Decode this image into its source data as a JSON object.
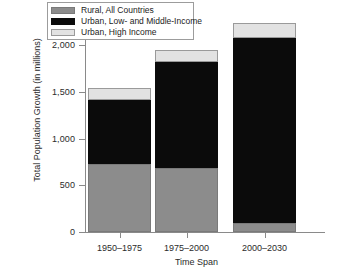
{
  "chart_data": {
    "type": "bar",
    "subtype": "stacked",
    "title": "",
    "xlabel": "Time Span",
    "ylabel": "Total Population Growth (in millions)",
    "categories": [
      "1950–1975",
      "1975–2000",
      "2000–2030"
    ],
    "ylim": [
      0,
      2200
    ],
    "yticks": [
      0,
      500,
      1000,
      1500,
      2000
    ],
    "ytick_labels": [
      "0",
      "500",
      "1,000",
      "1,500",
      "2,000"
    ],
    "grid": false,
    "legend_position": "top-left-inside",
    "series": [
      {
        "name": "Rural, All Countries",
        "color": "#8c8c8c",
        "values": [
          730,
          680,
          100
        ]
      },
      {
        "name": "Urban, Low- and Middle-Income",
        "color": "#0b0b0b",
        "values": [
          680,
          1135,
          1980
        ]
      },
      {
        "name": "Urban, High Income",
        "color": "#e2e2e2",
        "values": [
          130,
          130,
          155
        ]
      }
    ],
    "totals": [
      1540,
      1945,
      2235
    ]
  },
  "axes": {
    "y_title": "Total Population Growth (in millions)",
    "x_title": "Time Span",
    "y_tick_labels": [
      "2,000",
      "1,500",
      "1,000",
      "500",
      "0"
    ],
    "x_tick_labels": [
      "1950–1975",
      "1975–2000",
      "2000–2030"
    ]
  },
  "legend": {
    "items": [
      {
        "label": "Rural, All Countries",
        "color": "#8c8c8c"
      },
      {
        "label": "Urban, Low- and Middle-Income",
        "color": "#0b0b0b"
      },
      {
        "label": "Urban, High Income",
        "color": "#e2e2e2"
      }
    ]
  }
}
